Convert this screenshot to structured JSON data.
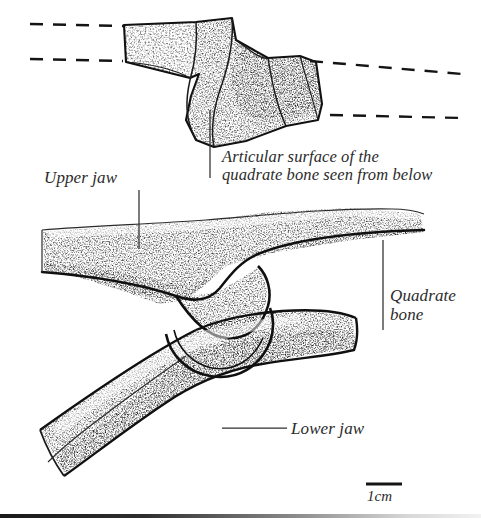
{
  "figure": {
    "style": "pen-and-ink stipple scientific illustration, black on white",
    "background_color": "#ffffff",
    "ink_color": "#1a1a1a",
    "label_color": "#2b2b2b"
  },
  "labels": {
    "upper_jaw": "Upper jaw",
    "articular_surface_line1": "Articular surface of the",
    "articular_surface_line2": "quadrate bone seen from below",
    "quadrate_line1": "Quadrate",
    "quadrate_line2": "bone",
    "lower_jaw": "Lower jaw",
    "scale": "1cm"
  },
  "leaders": [
    {
      "name": "upper-jaw-leader",
      "type": "vertical",
      "x": 139,
      "y1": 190,
      "y2": 249
    },
    {
      "name": "articular-surface-leader",
      "type": "vertical",
      "x": 210,
      "y1": 110,
      "y2": 178
    },
    {
      "name": "quadrate-bone-leader",
      "type": "vertical",
      "x": 383,
      "y1": 240,
      "y2": 330
    },
    {
      "name": "lower-jaw-leader",
      "type": "horizontal",
      "y": 428,
      "x1": 222,
      "x2": 287
    }
  ],
  "dashed_guides": [
    {
      "name": "upper-left-dashed",
      "x1": 30,
      "y1": 24,
      "x2": 124,
      "y2": 26
    },
    {
      "name": "lower-left-dashed",
      "x1": 30,
      "y1": 59,
      "x2": 123,
      "y2": 61
    },
    {
      "name": "upper-right-dashed",
      "x1": 310,
      "y1": 61,
      "x2": 462,
      "y2": 74
    },
    {
      "name": "lower-right-dashed",
      "x1": 330,
      "y1": 115,
      "x2": 462,
      "y2": 118
    }
  ],
  "scale_bar": {
    "x1": 366,
    "y1": 484,
    "x2": 402,
    "thickness": 3,
    "units": "1cm"
  },
  "bottom_rule": {
    "present": true,
    "y": 514,
    "fades": "left-to-right"
  }
}
